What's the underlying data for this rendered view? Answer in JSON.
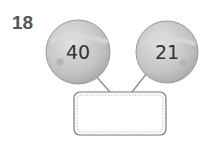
{
  "question": {
    "number": "18"
  },
  "balls": [
    {
      "label": "40"
    },
    {
      "label": "21"
    }
  ],
  "answer_box": {
    "value": ""
  },
  "colors": {
    "ball_fill": "#c4c4c4",
    "ball_highlight": "#dcdcdc",
    "line": "#8a8a8a",
    "box_border": "#777777"
  }
}
